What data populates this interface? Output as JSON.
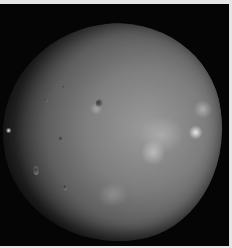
{
  "image": {
    "subject": "irregular grey cratered moon on black space background",
    "colors": {
      "border": "#e6e6e6",
      "background": "#050505",
      "surface_light": "#9a9a9a",
      "surface_dark": "#2e2e2e"
    }
  }
}
